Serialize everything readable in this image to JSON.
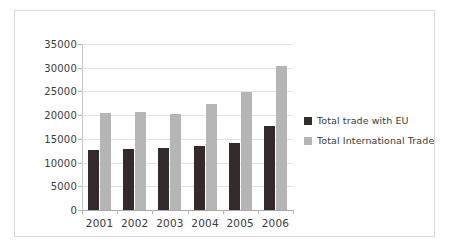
{
  "chart_data": {
    "type": "bar",
    "title": "",
    "xlabel": "",
    "ylabel": "",
    "categories": [
      "2001",
      "2002",
      "2003",
      "2004",
      "2005",
      "2006"
    ],
    "series": [
      {
        "name": "Total trade with EU",
        "color": "#332b2b",
        "values": [
          12600,
          12850,
          13000,
          13500,
          14100,
          17800
        ]
      },
      {
        "name": "Total International Trade",
        "color": "#b5b5b5",
        "values": [
          20500,
          20700,
          20300,
          22300,
          24900,
          30400
        ]
      }
    ],
    "ylim": [
      0,
      35000
    ],
    "ytick_values": [
      0,
      5000,
      10000,
      15000,
      20000,
      25000,
      30000,
      35000
    ],
    "ytick_labels": [
      "0",
      "5000",
      "10000",
      "15000",
      "20000",
      "25000",
      "30000",
      "35000"
    ],
    "grid": true,
    "legend_position": "right",
    "legend": [
      {
        "label": "Total trade with EU",
        "color": "#332b2b"
      },
      {
        "label": "Total International Trade",
        "color": "#b5b5b5"
      }
    ],
    "colors": {
      "border": "#d9d9d9",
      "gridline": "#e2e2e2",
      "axis": "#a8a8a8",
      "text": "#3b3b3b",
      "background": "#ffffff"
    }
  }
}
